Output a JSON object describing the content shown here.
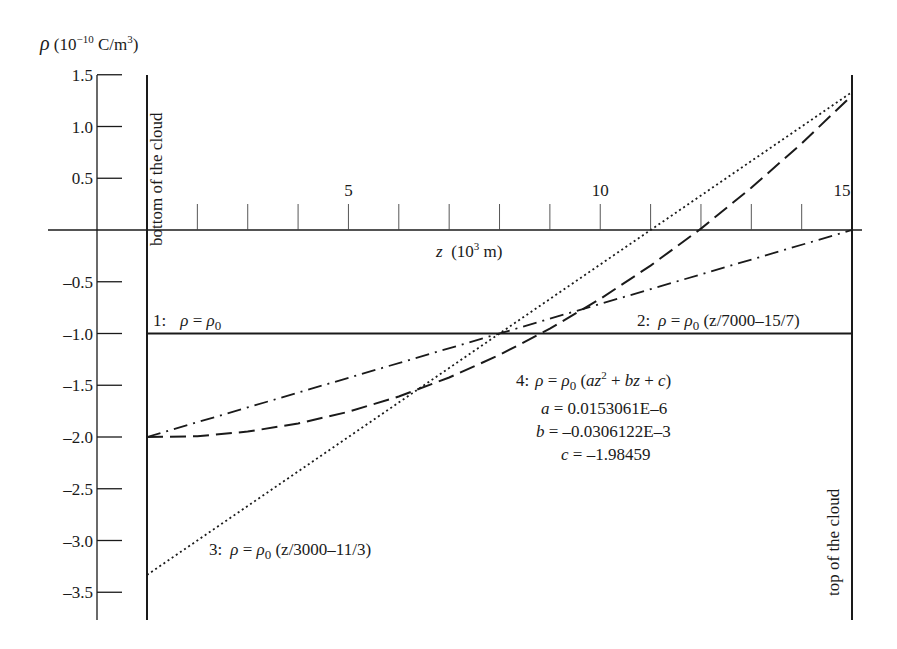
{
  "chart_data": {
    "type": "line",
    "title": "",
    "ylabel": "ρ (10⁻¹⁰ C/m³)",
    "ylabel_parts": {
      "rho": "ρ",
      "open": " (10",
      "exp": "−10",
      "unit": " C/m",
      "unit_exp": "3",
      "close": ")"
    },
    "xlabel": "z (10³ m)",
    "xlabel_parts": {
      "z": "z",
      "open": "  (10",
      "exp": "3",
      "unit": " m)"
    },
    "ylim": [
      -3.75,
      1.5
    ],
    "xlim": [
      1,
      15
    ],
    "y_ticks": [
      1.5,
      1.0,
      0.5,
      -0.5,
      -1.0,
      -1.5,
      -2.0,
      -2.5,
      -3.0,
      -3.5
    ],
    "y_tick_labels": [
      "1.5",
      "1.0",
      "0.5",
      "–0.5",
      "–1.0",
      "–1.5",
      "–2.0",
      "–2.5",
      "–3.0",
      "–3.5"
    ],
    "x_ticks": [
      2,
      3,
      4,
      5,
      6,
      7,
      8,
      9,
      10,
      11,
      12,
      13,
      14
    ],
    "x_tick_labels": [
      {
        "z": 5,
        "label": "5"
      },
      {
        "z": 10,
        "label": "10"
      },
      {
        "z": 15,
        "label": "15"
      }
    ],
    "boundary_labels": {
      "bottom": "bottom of the cloud",
      "top": "top of the cloud"
    },
    "grid": false,
    "series": [
      {
        "name": "1: ρ = ρ0",
        "style": "solid",
        "x": [
          1,
          15
        ],
        "values": [
          -1.0,
          -1.0
        ]
      },
      {
        "name": "2: ρ = ρ0 (z/7000–15/7)",
        "style": "dash-dot",
        "x": [
          1,
          15
        ],
        "values": [
          -2.0,
          0.0
        ]
      },
      {
        "name": "3: ρ = ρ0 (z/3000–11/3)",
        "style": "dotted",
        "x": [
          1,
          15
        ],
        "values": [
          -3.333,
          1.333
        ]
      },
      {
        "name": "4: ρ = ρ0 (az² + bz + c)",
        "style": "dashed",
        "x": [
          1,
          2,
          3,
          4,
          5,
          6,
          7,
          8,
          9,
          10,
          11,
          12,
          13,
          14,
          15
        ],
        "values": [
          -2.0,
          -1.992,
          -1.948,
          -1.87,
          -1.757,
          -1.609,
          -1.425,
          -1.207,
          -0.954,
          -0.666,
          -0.344,
          0.014,
          0.408,
          0.837,
          1.3
        ]
      }
    ],
    "annotations": {
      "curve1": {
        "num": "1:",
        "rho": "ρ",
        "eq": " = ",
        "rho0": "ρ",
        "sub": "0"
      },
      "curve2": {
        "num": "2:",
        "rho": "ρ",
        "eq": " = ",
        "rho0": "ρ",
        "sub": "0",
        "rest": " (z/7000–15/7)"
      },
      "curve3": {
        "num": "3:",
        "rho": "ρ",
        "eq": " = ",
        "rho0": "ρ",
        "sub": "0",
        "rest": " (z/3000–11/3)"
      },
      "curve4": {
        "num": "4:",
        "rho": "ρ",
        "eq": " = ",
        "rho0": "ρ",
        "sub": "0",
        "rest_open": " (",
        "az": "az",
        "sq": "2",
        "plus1": " + ",
        "bz": "bz",
        "plus2": " + ",
        "c": "c",
        "rest_close": ")"
      },
      "coef_a": {
        "var": "a",
        "value": " = 0.0153061E–6"
      },
      "coef_b": {
        "var": "b",
        "value": " = –0.0306122E–3"
      },
      "coef_c": {
        "var": "c",
        "value": " = –1.98459"
      }
    }
  }
}
